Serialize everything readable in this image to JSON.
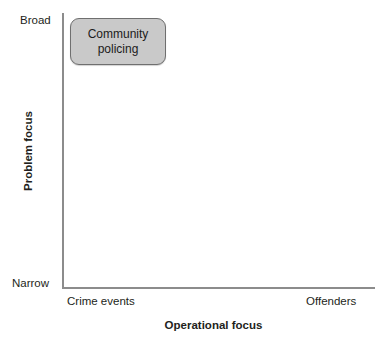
{
  "chart_data": {
    "type": "scatter",
    "title": "",
    "xlabel": "Operational focus",
    "ylabel": "Problem focus",
    "xticklabels": [
      "Crime events",
      "Offenders"
    ],
    "yticklabels": [
      "Narrow",
      "Broad"
    ],
    "xlim": [
      "Crime events",
      "Offenders"
    ],
    "ylim": [
      "Narrow",
      "Broad"
    ],
    "grid": false,
    "legend": false,
    "annotations": [
      {
        "label": "Community policing",
        "x": "Crime events",
        "y": "Broad",
        "fill": "#c9c9c9",
        "border": "#6f6f6f"
      }
    ]
  },
  "axes": {
    "y": {
      "title": "Problem focus",
      "tick_high": "Broad",
      "tick_low": "Narrow"
    },
    "x": {
      "title": "Operational focus",
      "tick_low": "Crime events",
      "tick_high": "Offenders"
    },
    "line_color": "#8c8c8c"
  },
  "nodes": [
    {
      "label": "Community policing",
      "line1": "Community",
      "line2": "policing"
    }
  ]
}
